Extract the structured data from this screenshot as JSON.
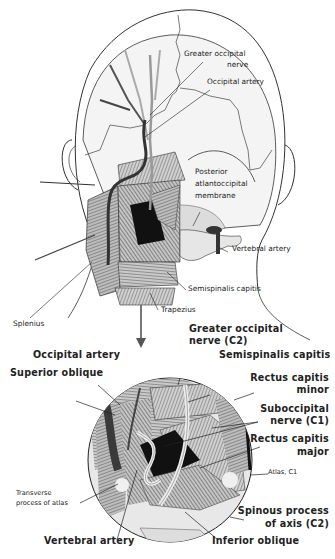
{
  "figure": {
    "colors": {
      "outline": "#333333",
      "skin": "#f2f2f2",
      "muscle": "#8a8a8a",
      "artery": "#3a3a3a",
      "nerve": "#ececec",
      "dark": "#111111"
    }
  },
  "labels_upper": {
    "greater_occipital_nerve_1": "Greater occipital",
    "greater_occipital_nerve_2": "nerve",
    "occipital_artery": "Occipital artery",
    "posterior_aom_1": "Posterior",
    "posterior_aom_2": "atlantoccipital",
    "posterior_aom_3": "membrane",
    "vertebral_artery": "Vertebral artery",
    "semispinalis_capitis": "Semispinalis capitis",
    "trapezius": "Trapezius",
    "splenius": "Splenius"
  },
  "labels_lower": {
    "greater_occipital_nerve_c2_1": "Greater occipital",
    "greater_occipital_nerve_c2_2": "nerve (C2)",
    "occipital_artery": "Occipital artery",
    "semispinalis_capitis": "Semispinalis capitis",
    "superior_oblique": "Superior oblique",
    "rectus_capitis_minor_1": "Rectus capitis",
    "rectus_capitis_minor_2": "minor",
    "suboccipital_nerve_1": "Suboccipital",
    "suboccipital_nerve_2": "nerve (C1)",
    "rectus_capitis_major_1": "Rectus capitis",
    "rectus_capitis_major_2": "major",
    "atlas_c1": "Atlas, C1",
    "transverse_process_1": "Transverse",
    "transverse_process_2": "process of atlas",
    "spinous_process_1": "Spinous process",
    "spinous_process_2": "of axis (C2)",
    "vertebral_artery": "Vertebral artery",
    "inferior_oblique": "Inferior oblique"
  }
}
